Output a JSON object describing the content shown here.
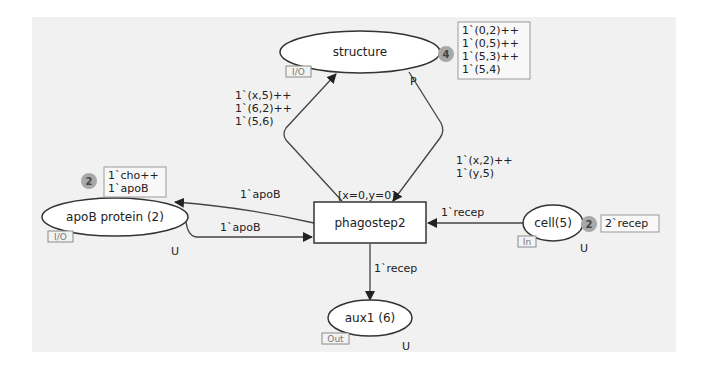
{
  "places": {
    "structure": {
      "name": "structure",
      "port": "I/O",
      "fusion": "P",
      "token_count": "4",
      "marking": [
        "1`(0,2)++",
        "1`(0,5)++",
        "1`(5,3)++",
        "1`(5,4)"
      ]
    },
    "apob": {
      "name": "apoB protein (2)",
      "port": "I/O",
      "fusion": "U",
      "token_count": "2",
      "marking": [
        "1`cho++",
        "1`apoB"
      ]
    },
    "cell": {
      "name": "cell(5)",
      "port": "In",
      "fusion": "U",
      "token_count": "2",
      "marking": [
        "2`recep"
      ]
    },
    "aux1": {
      "name": "aux1 (6)",
      "port": "Out",
      "fusion": "U"
    }
  },
  "transition": {
    "name": "phagostep2",
    "guard": "[x=0,y=0]"
  },
  "arcs": {
    "to_structure": [
      "1`(x,5)++",
      "1`(6,2)++",
      "1`(5,6)"
    ],
    "from_structure": [
      "1`(x,2)++",
      "1`(y,5)"
    ],
    "to_apob": "1`apoB",
    "from_apob": "1`apoB",
    "from_cell": "1`recep",
    "to_aux1": "1`recep"
  },
  "colors": {
    "canvas": "#f1f1f1",
    "line": "#333333",
    "node_fill": "#ffffff",
    "token_badge": "#a8a8a8",
    "port_tag": "#8a8a8a"
  }
}
